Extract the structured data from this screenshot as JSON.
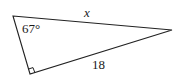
{
  "figure": {
    "type": "right-triangle",
    "stroke_color": "#222222",
    "vertices": {
      "top_left": [
        13,
        16
      ],
      "right": [
        172,
        30
      ],
      "bottom_right_angle": [
        30,
        74
      ]
    },
    "labels": {
      "angle": "67°",
      "hypotenuse": "x",
      "leg": "18"
    }
  }
}
